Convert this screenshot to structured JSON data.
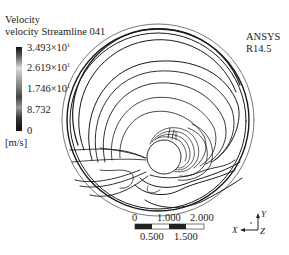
{
  "legend": {
    "title": "Velocity",
    "subtitle": "velocity Streamline 041",
    "ticks": [
      {
        "mantissa": "3.493×10",
        "exp": "1"
      },
      {
        "mantissa": "2.619×10",
        "exp": "1"
      },
      {
        "mantissa": "1.746×10",
        "exp": "1"
      },
      {
        "mantissa": "8.732",
        "exp": ""
      },
      {
        "mantissa": "0",
        "exp": ""
      }
    ],
    "unit": "[m/s]"
  },
  "watermark": {
    "line1": "ANSYS",
    "line2": "R14.5"
  },
  "scale_bar": {
    "top_labels": [
      "0",
      "1.000",
      "2.000"
    ],
    "bottom_labels": [
      "0.500",
      "1.500"
    ]
  },
  "axes_triad": {
    "x": "X",
    "y": "Y",
    "z": "Z"
  },
  "colors": {
    "streamline": "#1a1a1a",
    "background": "#ffffff"
  }
}
